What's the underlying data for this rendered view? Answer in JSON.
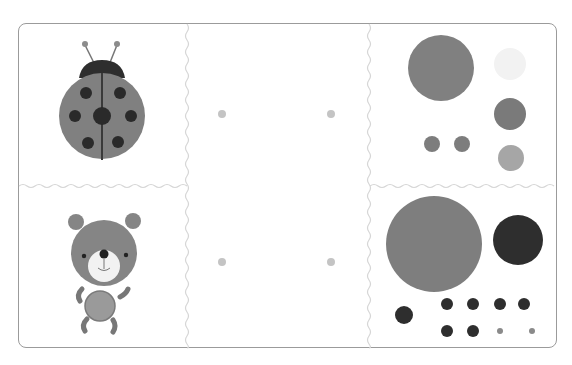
{
  "page": {
    "top_text": ""
  },
  "panels": {
    "left_column": [
      {
        "name": "ladybug",
        "label": "Ladybug"
      },
      {
        "name": "bear",
        "label": "Bear"
      }
    ],
    "middle_column": {
      "description": "Connect-the-dots pairs",
      "dots": [
        {
          "x": 222,
          "y": 114
        },
        {
          "x": 331,
          "y": 114
        },
        {
          "x": 222,
          "y": 262
        },
        {
          "x": 331,
          "y": 262
        }
      ]
    },
    "right_column": [
      {
        "name": "ladybug-parts",
        "circles": [
          {
            "cx": 441,
            "cy": 68,
            "r": 33,
            "color": "#808080"
          },
          {
            "cx": 510,
            "cy": 64,
            "r": 16,
            "color": "#f2f2f2"
          },
          {
            "cx": 510,
            "cy": 114,
            "r": 16,
            "color": "#7a7a7a"
          },
          {
            "cx": 432,
            "cy": 144,
            "r": 8,
            "color": "#7d7d7d"
          },
          {
            "cx": 462,
            "cy": 144,
            "r": 8,
            "color": "#7d7d7d"
          },
          {
            "cx": 511,
            "cy": 158,
            "r": 13,
            "color": "#a6a6a6"
          }
        ]
      },
      {
        "name": "bear-parts",
        "circles": [
          {
            "cx": 434,
            "cy": 244,
            "r": 48,
            "color": "#7e7e7e"
          },
          {
            "cx": 518,
            "cy": 240,
            "r": 25,
            "color": "#2e2e2e"
          },
          {
            "cx": 404,
            "cy": 315,
            "r": 9,
            "color": "#2e2e2e"
          },
          {
            "cx": 447,
            "cy": 304,
            "r": 6,
            "color": "#2e2e2e"
          },
          {
            "cx": 473,
            "cy": 304,
            "r": 6,
            "color": "#2e2e2e"
          },
          {
            "cx": 500,
            "cy": 304,
            "r": 6,
            "color": "#2e2e2e"
          },
          {
            "cx": 524,
            "cy": 304,
            "r": 6,
            "color": "#2e2e2e"
          },
          {
            "cx": 447,
            "cy": 331,
            "r": 6,
            "color": "#2e2e2e"
          },
          {
            "cx": 473,
            "cy": 331,
            "r": 6,
            "color": "#2e2e2e"
          },
          {
            "cx": 500,
            "cy": 331,
            "r": 3,
            "color": "#8a8a8a"
          },
          {
            "cx": 532,
            "cy": 331,
            "r": 3,
            "color": "#8a8a8a"
          }
        ]
      }
    ]
  },
  "colors": {
    "frame": "#9b9b9b",
    "divider": "#d8d8d8",
    "dot": "#c4c4c4",
    "body_gray": "#808080",
    "dark": "#2a2a2a"
  }
}
